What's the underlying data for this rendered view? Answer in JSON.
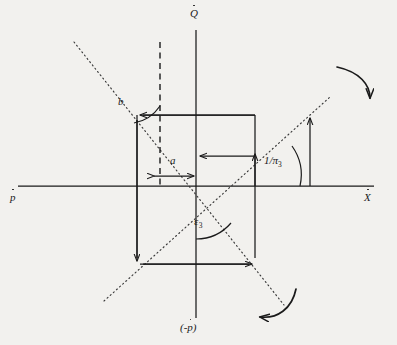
{
  "figure": {
    "background_color": "#f2f1ee",
    "ink_color": "#1a1a1a",
    "width": 397,
    "height": 345,
    "origin": {
      "x": 196,
      "y": 186
    },
    "axes": [
      {
        "name": "vertical-up",
        "label_base": "Q",
        "label_full": "Q̇",
        "accent": "dot",
        "position": "top"
      },
      {
        "name": "horizontal-left",
        "label_base": "p",
        "label_full": "ṗ",
        "accent": "dot",
        "position": "left"
      },
      {
        "name": "horizontal-right",
        "label_base": "X",
        "label_full": "Ẋ",
        "accent": "dot",
        "position": "right"
      },
      {
        "name": "vertical-down",
        "label_base": "(-p)",
        "label_full": "(-ṗ)",
        "accent": "dot",
        "position": "bottom"
      }
    ],
    "annotations": [
      {
        "name": "angle-b",
        "text": "b",
        "kind": "angle",
        "x": 118,
        "y": 98,
        "style": "italic"
      },
      {
        "name": "angle-a",
        "text": "a",
        "kind": "length",
        "x": 172,
        "y": 157,
        "style": "italic"
      },
      {
        "name": "ratio-one-over-pi3",
        "text": "1/π",
        "sub": "3",
        "kind": "magnitude",
        "x": 266,
        "y": 158,
        "style": "italic"
      },
      {
        "name": "angle-epsilon3",
        "text": "ε",
        "sub": "3",
        "kind": "angle",
        "x": 196,
        "y": 218,
        "style": "italic"
      }
    ],
    "lines": [
      {
        "name": "dotted-line-steep",
        "style": "dotted",
        "from": [
          74,
          42
        ],
        "to": [
          284,
          305
        ]
      },
      {
        "name": "dotted-line-shallow",
        "style": "dotted",
        "from": [
          104,
          301
        ],
        "to": [
          330,
          97
        ]
      },
      {
        "name": "dashed-vertical",
        "style": "dashed",
        "from": [
          160,
          42
        ],
        "to": [
          160,
          186
        ]
      }
    ],
    "rotation_arrows": [
      {
        "name": "rotation-arrow-top-right",
        "direction": "clockwise",
        "position": "top-right"
      },
      {
        "name": "rotation-arrow-bottom-right",
        "direction": "clockwise",
        "position": "bottom-right"
      }
    ],
    "rectangle": {
      "name": "component-rectangle",
      "left": 137,
      "right": 255,
      "top": 115,
      "bottom": 264
    }
  }
}
